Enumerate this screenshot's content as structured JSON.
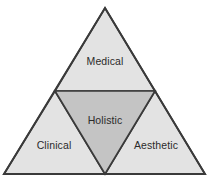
{
  "diagram": {
    "type": "nested-triangle-venn",
    "background_color": "#ffffff",
    "stroke_color": "#3a3a3a",
    "outer_fill": "#e3e3e3",
    "inner_fill": "#c4c4c4",
    "text_color": "#2b2b2b",
    "outer_triangle": {
      "apex": [
        105,
        8
      ],
      "bottom_left": [
        4,
        174
      ],
      "bottom_right": [
        205,
        174
      ]
    },
    "inner_triangle": {
      "left_midpoint": [
        55,
        91
      ],
      "right_midpoint": [
        155,
        91
      ],
      "bottom_midpoint": [
        105,
        174
      ]
    },
    "regions": [
      {
        "id": "medical",
        "label": "Medical",
        "position": "top",
        "fill": "#e3e3e3",
        "label_x": 105,
        "label_y": 61
      },
      {
        "id": "holistic",
        "label": "Holistic",
        "position": "center-inverted",
        "fill": "#c4c4c4",
        "label_x": 105,
        "label_y": 120
      },
      {
        "id": "clinical",
        "label": "Clinical",
        "position": "bottom-left",
        "fill": "#e3e3e3",
        "label_x": 54,
        "label_y": 145
      },
      {
        "id": "aesthetic",
        "label": "Aesthetic",
        "position": "bottom-right",
        "fill": "#e3e3e3",
        "label_x": 156,
        "label_y": 145
      }
    ]
  }
}
